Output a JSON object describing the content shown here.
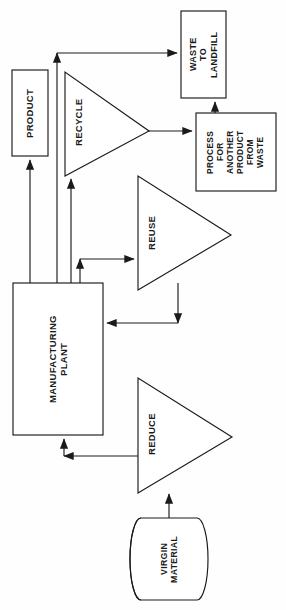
{
  "diagram": {
    "orientation": "rotated-90",
    "stroke_color": "#1a1a1a",
    "fill_color": "#ffffff",
    "background_color": "#fefefe",
    "nodes": {
      "product": {
        "shape": "rectangle",
        "label_lines": [
          "PRODUCT"
        ],
        "label_full": "PRODUCT"
      },
      "waste_to_landfill": {
        "shape": "rectangle",
        "label_lines": [
          "WASTE",
          "TO",
          "LANDFILL"
        ],
        "label_full": "WASTE TO LANDFILL"
      },
      "process_another_product": {
        "shape": "rectangle",
        "label_lines": [
          "PROCESS",
          "FOR",
          "ANOTHER",
          "PRODUCT",
          "FROM",
          "WASTE"
        ],
        "label_full": "PROCESS FOR ANOTHER PRODUCT FROM WASTE"
      },
      "manufacturing_plant": {
        "shape": "rectangle",
        "label_lines": [
          "MANUFACTURING",
          "PLANT"
        ],
        "label_full": "MANUFACTURING PLANT"
      },
      "virgin_material": {
        "shape": "cylinder",
        "label_lines": [
          "VIRGIN",
          "MATERIAL"
        ],
        "label_full": "VIRGIN MATERIAL"
      },
      "recycle": {
        "shape": "triangle-right",
        "label_lines": [
          "RECYCLE"
        ],
        "label_full": "RECYCLE"
      },
      "reuse": {
        "shape": "triangle-right",
        "label_lines": [
          "REUSE"
        ],
        "label_full": "REUSE"
      },
      "reduce": {
        "shape": "triangle-right",
        "label_lines": [
          "REDUCE"
        ],
        "label_full": "REDUCE"
      }
    },
    "edges": [
      {
        "id": "plant-to-product",
        "from": "manufacturing_plant",
        "to": "product"
      },
      {
        "id": "plant-to-landfill",
        "from": "manufacturing_plant",
        "to": "waste_to_landfill"
      },
      {
        "id": "plant-to-recycle",
        "from": "manufacturing_plant",
        "to": "recycle"
      },
      {
        "id": "recycle-to-process",
        "from": "recycle",
        "to": "process_another_product"
      },
      {
        "id": "process-to-landfill",
        "from": "process_another_product",
        "to": "waste_to_landfill"
      },
      {
        "id": "plant-to-reuse",
        "from": "manufacturing_plant",
        "to": "reuse"
      },
      {
        "id": "reuse-to-plant",
        "from": "reuse",
        "to": "manufacturing_plant"
      },
      {
        "id": "reduce-to-plant",
        "from": "reduce",
        "to": "manufacturing_plant"
      },
      {
        "id": "virgin-to-reduce",
        "from": "virgin_material",
        "to": "reduce"
      }
    ]
  }
}
